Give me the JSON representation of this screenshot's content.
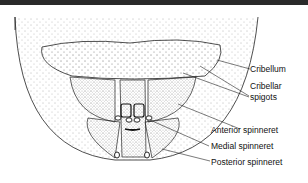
{
  "diagram": {
    "labels": {
      "cribellum": "Cribellum",
      "cribellar_line1": "Cribellar",
      "cribellar_line2": "spigots",
      "anterior": "Anterior spinneret",
      "medial": "Medial spinneret",
      "posterior": "Posterior spinneret"
    },
    "colors": {
      "line": "#222222",
      "stipple": "#555555",
      "topbar": "#2a2a2a"
    }
  }
}
